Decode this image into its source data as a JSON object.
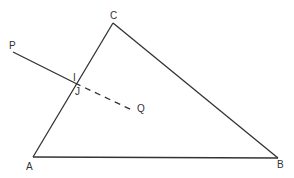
{
  "diagram": {
    "type": "geometry",
    "stroke_color": "#333333",
    "background": "#ffffff",
    "points": {
      "A": {
        "label": "A",
        "x": 33,
        "y": 157
      },
      "B": {
        "label": "B",
        "x": 278,
        "y": 158
      },
      "C": {
        "label": "C",
        "x": 113,
        "y": 23
      },
      "P": {
        "label": "P",
        "x": 13,
        "y": 52
      },
      "Q": {
        "label": "Q",
        "x": 134,
        "y": 111
      },
      "I": {
        "label": "I",
        "x": 75,
        "y": 83
      },
      "J": {
        "label": "J",
        "x": 75,
        "y": 83
      }
    },
    "segments": [
      {
        "from": "A",
        "to": "B",
        "style": "solid"
      },
      {
        "from": "B",
        "to": "C",
        "style": "solid"
      },
      {
        "from": "C",
        "to": "A",
        "style": "solid"
      },
      {
        "from": "P",
        "to": "I",
        "style": "solid"
      },
      {
        "from": "J",
        "to": "Q",
        "style": "dashed"
      }
    ],
    "labels": {
      "A": "A",
      "B": "B",
      "C": "C",
      "P": "P",
      "Q": "Q",
      "I": "I",
      "J": "J"
    }
  }
}
